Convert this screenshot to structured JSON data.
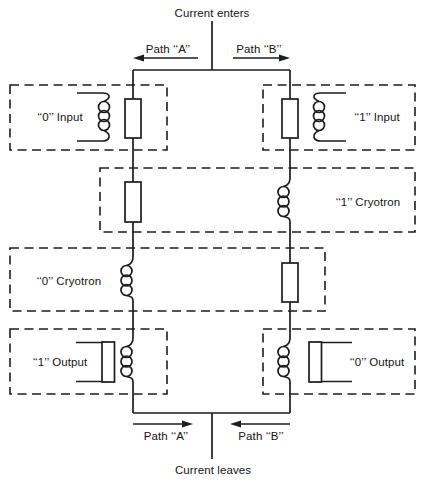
{
  "colors": {
    "line": "#1d1d1d",
    "text": "#141414",
    "background": "#ffffff"
  },
  "flow": {
    "enters": "Current enters",
    "leaves": "Current leaves",
    "path_a": "Path ‘‘A’’",
    "path_b": "Path ‘‘B’’"
  },
  "stages": {
    "input_0": "‘‘0’’ Input",
    "input_1": "‘‘1’’ Input",
    "cryotron_1": "‘‘1’’ Cryotron",
    "cryotron_0": "‘‘0’’ Cryotron",
    "output_1": "‘‘1’’ Output",
    "output_0": "‘‘0’’ Output"
  }
}
